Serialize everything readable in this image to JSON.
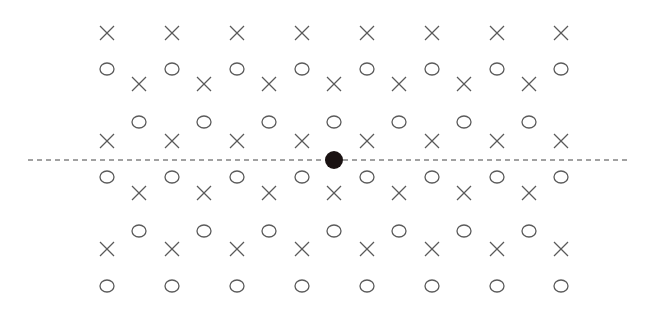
{
  "diagram": {
    "type": "lattice-pattern",
    "colors": {
      "symbol_stroke": "#5a5a5a",
      "dashed_line": "#444444",
      "dot": "#1a1212",
      "background": "#ffffff"
    },
    "symbol_size": {
      "x_half": 7,
      "o_rx": 7,
      "o_ry": 6
    },
    "main_columns_x": [
      107,
      172,
      237,
      302,
      367,
      432,
      497,
      561
    ],
    "offset_columns_x": [
      139,
      204,
      269,
      334,
      399,
      464,
      529
    ],
    "main_rows": [
      {
        "y": 33,
        "symbol": "x"
      },
      {
        "y": 69,
        "symbol": "o"
      },
      {
        "y": 141,
        "symbol": "x"
      },
      {
        "y": 177,
        "symbol": "o"
      },
      {
        "y": 249,
        "symbol": "x"
      },
      {
        "y": 286,
        "symbol": "o"
      }
    ],
    "offset_rows": [
      {
        "y": 84,
        "symbol": "x"
      },
      {
        "y": 122,
        "symbol": "o"
      },
      {
        "y": 193,
        "symbol": "x"
      },
      {
        "y": 231,
        "symbol": "o"
      }
    ],
    "dashed_line": {
      "x1": 28,
      "x2": 627,
      "y": 160
    },
    "center_dot": {
      "cx": 334,
      "cy": 160,
      "r": 9
    }
  }
}
